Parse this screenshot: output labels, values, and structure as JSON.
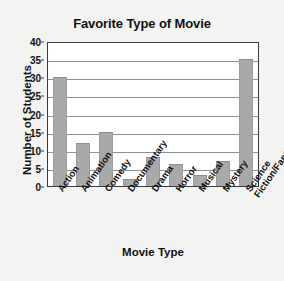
{
  "chart_data": {
    "type": "bar",
    "title": "Favorite Type of Movie",
    "xlabel": "Movie Type",
    "ylabel": "Number of Students",
    "categories": [
      "Action",
      "Animation",
      "Comedy",
      "Documentary",
      "Drama",
      "Horror",
      "Musical",
      "Mystery",
      "Science Fiction/Fantasy"
    ],
    "values": [
      30,
      12,
      15,
      2,
      8,
      6,
      3,
      7,
      35
    ],
    "ylim": [
      0,
      40
    ],
    "ytick_labels": [
      "0",
      "5",
      "10",
      "15",
      "20",
      "25",
      "30",
      "35",
      "40"
    ],
    "ytick_values": [
      0,
      5,
      10,
      15,
      20,
      25,
      30,
      35,
      40
    ],
    "grid": true,
    "legend": false,
    "bar_color": "#a9a9a9",
    "plot_background": "#ffffff",
    "figure_background": "#f3f3f1",
    "axis_color": "#3a3a3a"
  }
}
